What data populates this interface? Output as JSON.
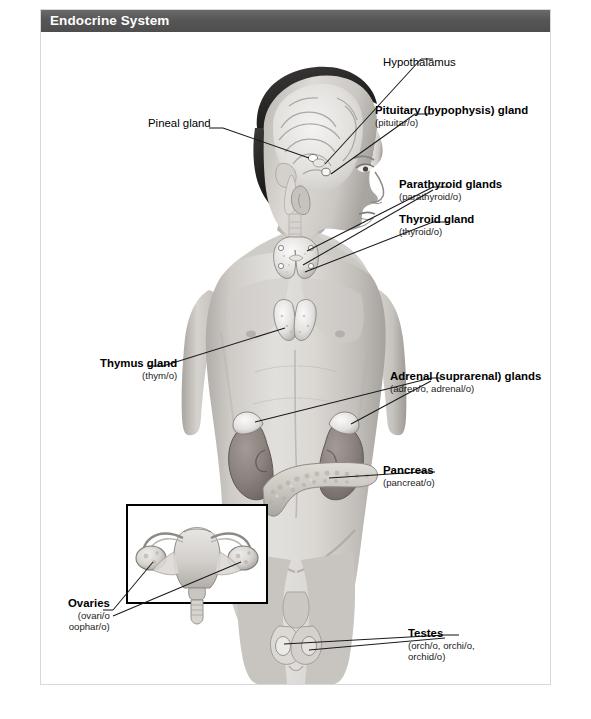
{
  "header": {
    "title": "Endocrine System"
  },
  "figure": {
    "alt_name": "endocrine-system-anatomical-diagram",
    "body_view": "anterior male torso with head in profile",
    "inset": {
      "name": "ovaries-uterus-inset",
      "description": "uterus with fallopian tubes and ovaries"
    }
  },
  "labels": {
    "hypothalamus": {
      "lead": "Hypothalamus",
      "sub": "",
      "bold": false
    },
    "pituitary": {
      "lead": "Pituitary (hypophysis) gland",
      "sub": "(pituitar/o)",
      "bold": true
    },
    "pineal": {
      "lead": "Pineal gland",
      "sub": "",
      "bold": false
    },
    "parathyroid": {
      "lead": "Parathyroid glands",
      "sub": "(parathyroid/o)",
      "bold": true
    },
    "thyroid": {
      "lead": "Thyroid gland",
      "sub": "(thyroid/o)",
      "bold": true
    },
    "thymus": {
      "lead": "Thymus gland",
      "sub": "(thym/o)",
      "bold": true
    },
    "adrenal": {
      "lead": "Adrenal (suprarenal) glands",
      "sub": "(adren/o, adrenal/o)",
      "bold": true
    },
    "pancreas": {
      "lead": "Pancreas",
      "sub": "(pancreat/o)",
      "bold": true
    },
    "ovaries": {
      "lead": "Ovaries",
      "sub": "(ovari/o",
      "sub2": "oophar/o)",
      "bold": true
    },
    "testes": {
      "lead": "Testes",
      "sub": "(orch/o, orchi/o,",
      "sub2": "orchid/o)",
      "bold": true
    }
  },
  "colors": {
    "title_bar": "#565656",
    "title_text": "#ffffff",
    "page_border": "#d8d8d8",
    "background": "#ffffff",
    "leader_line": "#1a1a1a",
    "skin_light": "#d9d7d4",
    "skin_mid": "#bdbab6",
    "skin_dark": "#9b9894",
    "hair_dark": "#2e2d2c",
    "kidney": "#8d8683",
    "pancreas": "#c9c5bf",
    "gland_light": "#efeeec",
    "inset_border": "#000000"
  }
}
